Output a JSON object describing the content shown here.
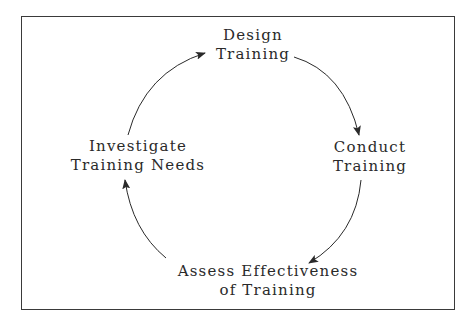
{
  "diagram": {
    "type": "cycle",
    "direction": "clockwise",
    "nodes": [
      {
        "id": "design",
        "lines": [
          "Design",
          "Training"
        ]
      },
      {
        "id": "conduct",
        "lines": [
          "Conduct",
          "Training"
        ]
      },
      {
        "id": "assess",
        "lines": [
          "Assess Effectiveness",
          "of Training"
        ]
      },
      {
        "id": "investigate",
        "lines": [
          "Investigate",
          "Training Needs"
        ]
      }
    ],
    "edges": [
      {
        "from": "design",
        "to": "conduct"
      },
      {
        "from": "conduct",
        "to": "assess"
      },
      {
        "from": "assess",
        "to": "investigate"
      },
      {
        "from": "investigate",
        "to": "design"
      }
    ],
    "colors": {
      "line": "#2a2a2a",
      "text": "#2a2a2a",
      "background": "#ffffff",
      "border": "#3a3a3a"
    }
  }
}
